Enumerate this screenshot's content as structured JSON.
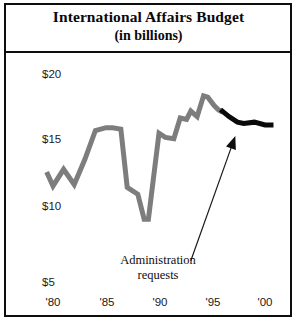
{
  "figure": {
    "title_line1": "International Affairs Budget",
    "title_line2": "(in billions)",
    "frame_color": "#0d0d0d",
    "background": "#ffffff"
  },
  "annotation": {
    "line1": "Administration",
    "line2": "requests",
    "arrow_name": "annotation-arrow"
  },
  "chart_data": {
    "type": "line",
    "title": "International Affairs Budget (in billions)",
    "subtitle": "(in billions)",
    "xlabel": "",
    "ylabel": "",
    "ylim": [
      5,
      20
    ],
    "xlim": [
      1980,
      2001
    ],
    "grid": false,
    "legend": false,
    "yticks": [
      20,
      15,
      10,
      5
    ],
    "ytick_labels": [
      "$20",
      "$15",
      "$10",
      "$5"
    ],
    "xticks": [
      1980,
      1985,
      1990,
      1995,
      2000
    ],
    "xtick_labels": [
      "'80",
      "'85",
      "'90",
      "'95",
      "'00"
    ],
    "series": [
      {
        "name": "Actual budget",
        "color": "#7d7d7d",
        "line_width": 5,
        "x": [
          1979.4,
          1980.0,
          1981.0,
          1982.0,
          1983.0,
          1984.0,
          1985.0,
          1985.6,
          1986.4,
          1987.0,
          1987.4,
          1988.0,
          1988.6,
          1989.0,
          1990.0,
          1990.6,
          1991.4,
          1992.0,
          1992.6,
          1993.0,
          1993.6,
          1994.2,
          1994.6,
          1995.2,
          1995.6,
          1996.0
        ],
        "y": [
          13.0,
          12.0,
          13.2,
          12.1,
          13.9,
          16.0,
          16.2,
          16.2,
          16.1,
          11.9,
          11.7,
          11.4,
          9.6,
          9.6,
          15.8,
          15.5,
          15.4,
          16.9,
          16.8,
          17.4,
          17.0,
          18.5,
          18.4,
          17.8,
          17.5,
          17.3
        ]
      },
      {
        "name": "Administration requests",
        "color": "#0a0a0a",
        "line_width": 5,
        "x": [
          1995.8,
          1996.6,
          1997.4,
          1998.0,
          1999.0,
          2000.0,
          2000.8
        ],
        "y": [
          17.5,
          17.0,
          16.6,
          16.5,
          16.6,
          16.4,
          16.4
        ]
      }
    ],
    "annotations": [
      {
        "text": "Administration requests",
        "x": 1993.0,
        "y": 6.6,
        "points_to_x": 1997.2,
        "points_to_y": 15.6
      }
    ]
  },
  "axis_labels": {
    "y": [
      {
        "label": "$20",
        "value": 20
      },
      {
        "label": "$15",
        "value": 15
      },
      {
        "label": "$10",
        "value": 10
      },
      {
        "label": "$5",
        "value": 5
      }
    ],
    "x": [
      {
        "label": "'80",
        "value": 1980
      },
      {
        "label": "'85",
        "value": 1985
      },
      {
        "label": "'90",
        "value": 1990
      },
      {
        "label": "'95",
        "value": 1995
      },
      {
        "label": "'00",
        "value": 2000
      }
    ]
  }
}
